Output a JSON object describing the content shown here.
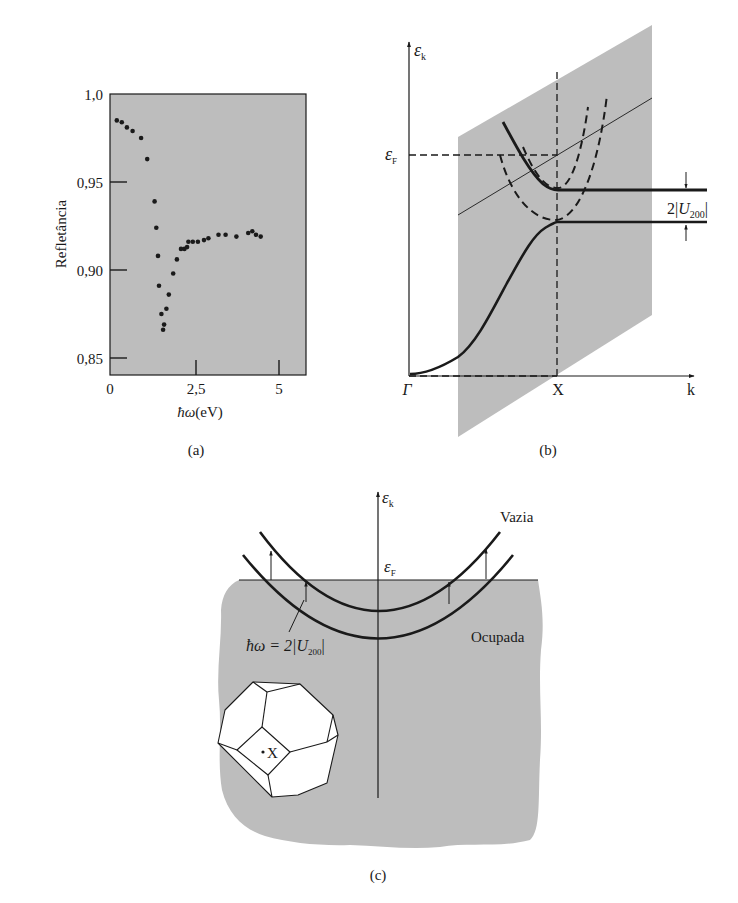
{
  "figure": {
    "colors": {
      "panel_gray": "#bdbdbd",
      "ink": "#1a1a1a",
      "paper": "#ffffff"
    },
    "panel_a": {
      "caption": "(a)",
      "ylabel": "Refletância",
      "xlabel_symbol": "ħω",
      "xlabel_unit": "(eV)",
      "yticks": [
        "1,0",
        "0,95",
        "0,90",
        "0,85"
      ],
      "xticks": [
        "0",
        "2,5",
        "5"
      ]
    },
    "panel_b": {
      "caption": "(b)",
      "yaxis_symbol": "ε",
      "yaxis_sub": "k",
      "fermi_symbol": "ε",
      "fermi_sub": "F",
      "xaxis_label": "k",
      "gamma_label": "Γ",
      "x_point_label": "X",
      "gap_label_prefix": "2|",
      "gap_label_U": "U",
      "gap_label_sub": "200",
      "gap_label_suffix": "|"
    },
    "panel_c": {
      "caption": "(c)",
      "yaxis_symbol": "ε",
      "yaxis_sub": "k",
      "fermi_symbol": "ε",
      "fermi_sub": "F",
      "empty_label": "Vazia",
      "occupied_label": "Ocupada",
      "transition_label_prefix": "ħω = 2|",
      "transition_label_U": "U",
      "transition_label_sub": "200",
      "transition_label_suffix": "|",
      "bz_point_label": "X"
    }
  },
  "chart_data": [
    {
      "type": "scatter",
      "title": "",
      "xlabel": "ħω(eV)",
      "ylabel": "Refletância",
      "xlim": [
        0,
        5.8
      ],
      "ylim": [
        0.84,
        1.0
      ],
      "xticks": [
        0,
        2.5,
        5
      ],
      "xtick_labels": [
        "0",
        "2,5",
        "5"
      ],
      "yticks": [
        0.85,
        0.9,
        0.95,
        1.0
      ],
      "ytick_labels": [
        "0,85",
        "0,90",
        "0,95",
        "1,0"
      ],
      "grid": false,
      "legend": null,
      "background": "#bdbdbd",
      "series": [
        {
          "name": "Refletância",
          "x": [
            0.2,
            0.35,
            0.5,
            0.67,
            0.92,
            1.1,
            1.32,
            1.37,
            1.42,
            1.45,
            1.52,
            1.57,
            1.6,
            1.67,
            1.74,
            1.87,
            1.98,
            2.1,
            2.2,
            2.28,
            2.32,
            2.45,
            2.6,
            2.78,
            2.91,
            3.21,
            3.42,
            3.74,
            4.09,
            4.21,
            4.32,
            4.46
          ],
          "y": [
            0.985,
            0.984,
            0.981,
            0.979,
            0.975,
            0.963,
            0.939,
            0.924,
            0.908,
            0.891,
            0.875,
            0.866,
            0.869,
            0.878,
            0.886,
            0.898,
            0.906,
            0.912,
            0.912,
            0.913,
            0.916,
            0.916,
            0.916,
            0.917,
            0.918,
            0.92,
            0.92,
            0.919,
            0.921,
            0.922,
            0.92,
            0.919
          ]
        }
      ]
    },
    {
      "type": "line",
      "title": "Band structure along Γ–X",
      "xlabel": "k",
      "ylabel": "ε_k",
      "x_markers": [
        "Γ",
        "X"
      ],
      "y_markers": [
        "ε_F"
      ],
      "annotations": [
        "2|U_200|"
      ],
      "series": [
        {
          "name": "lower band (solid)",
          "style": "solid"
        },
        {
          "name": "upper band (solid)",
          "style": "solid"
        },
        {
          "name": "free-electron parabola 1 (dashed)",
          "style": "dashed"
        },
        {
          "name": "free-electron parabola 2 (dashed)",
          "style": "dashed"
        }
      ]
    },
    {
      "type": "line",
      "title": "Interband transitions near Fermi level",
      "xlabel": "",
      "ylabel": "ε_k",
      "y_markers": [
        "ε_F"
      ],
      "annotations": [
        "Vazia",
        "Ocupada",
        "ħω = 2|U_200|",
        "X"
      ],
      "series": [
        {
          "name": "upper band",
          "style": "solid"
        },
        {
          "name": "lower band",
          "style": "solid"
        }
      ]
    }
  ]
}
